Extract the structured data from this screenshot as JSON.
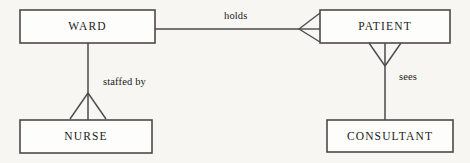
{
  "diagram": {
    "type": "entity-relationship-diagram",
    "notation": "crows-foot",
    "background_color": "#f7f6f3",
    "line_color": "#4a4a4a",
    "text_color": "#1a1a1a",
    "box_fill_color": "#fdfdfc",
    "entities": [
      {
        "id": "ward",
        "label": "WARD",
        "x": 20,
        "y": 10,
        "width": 135,
        "height": 33
      },
      {
        "id": "patient",
        "label": "PATIENT",
        "x": 320,
        "y": 10,
        "width": 130,
        "height": 33
      },
      {
        "id": "nurse",
        "label": "NURSE",
        "x": 20,
        "y": 120,
        "width": 132,
        "height": 33
      },
      {
        "id": "consultant",
        "label": "CONSULTANT",
        "x": 327,
        "y": 120,
        "width": 126,
        "height": 32
      }
    ],
    "relationships": [
      {
        "id": "holds",
        "label": "holds",
        "from": "ward",
        "to": "patient",
        "orientation": "horizontal",
        "crow_foot_at": "patient",
        "label_x": 224,
        "label_y": 17
      },
      {
        "id": "staffed-by",
        "label": "staffed by",
        "from": "ward",
        "to": "nurse",
        "orientation": "vertical",
        "crow_foot_at": "nurse",
        "label_x": 103,
        "label_y": 83
      },
      {
        "id": "sees",
        "label": "sees",
        "from": "patient",
        "to": "consultant",
        "orientation": "vertical",
        "crow_foot_at": "patient",
        "label_x": 399,
        "label_y": 78
      }
    ]
  }
}
